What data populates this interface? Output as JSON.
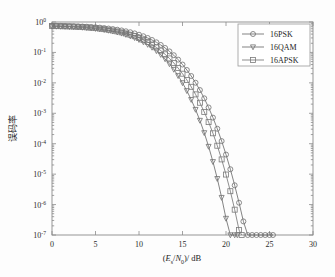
{
  "chart_data": {
    "type": "line",
    "title": "",
    "xlabel": "(E_s/N_0)/dB",
    "xlabel_parts": {
      "open": "(",
      "E": "E",
      "Esub": "s",
      "slash": "/",
      "N": "N",
      "Nsub": "0",
      "close": ")",
      "unit": "/ dB"
    },
    "ylabel": "误码率",
    "ylabel_chars": [
      "误",
      "码",
      "率"
    ],
    "xlim": [
      0,
      30
    ],
    "ylim": [
      1e-07,
      1
    ],
    "yscale": "log",
    "xticks": [
      0,
      5,
      10,
      15,
      20,
      25,
      30
    ],
    "xticklabels": [
      "0",
      "5",
      "10",
      "15",
      "20",
      "25",
      "30"
    ],
    "yticks": [
      1,
      0.1,
      0.01,
      0.001,
      0.0001,
      1e-05,
      1e-06,
      1e-07
    ],
    "yticklabels": [
      "10^0",
      "10^-1",
      "10^-2",
      "10^-3",
      "10^-4",
      "10^-5",
      "10^-6",
      "10^-7"
    ],
    "yticklabel_exponents": [
      "0",
      "-1",
      "-2",
      "-3",
      "-4",
      "-5",
      "-6",
      "-7"
    ],
    "ymantissa": "10",
    "grid": false,
    "legend_position": "upper right",
    "series": [
      {
        "name": "16PSK",
        "marker": "circle",
        "color": "#6e6e6e",
        "x": [
          0,
          0.5,
          1,
          1.5,
          2,
          2.5,
          3,
          3.5,
          4,
          4.5,
          5,
          5.5,
          6,
          6.5,
          7,
          7.5,
          8,
          8.5,
          9,
          9.5,
          10,
          10.5,
          11,
          11.5,
          12,
          12.5,
          13,
          13.5,
          14,
          14.5,
          15,
          15.5,
          16,
          16.5,
          17,
          17.5,
          18,
          18.5,
          19,
          19.5,
          20,
          20.5,
          21,
          21.5,
          22,
          22.5,
          23,
          23.5,
          24,
          24.5,
          25,
          25.4
        ],
        "y": [
          0.75,
          0.748,
          0.745,
          0.74,
          0.735,
          0.728,
          0.72,
          0.71,
          0.7,
          0.685,
          0.67,
          0.652,
          0.632,
          0.61,
          0.585,
          0.558,
          0.528,
          0.495,
          0.46,
          0.422,
          0.382,
          0.34,
          0.298,
          0.256,
          0.215,
          0.176,
          0.14,
          0.108,
          0.081,
          0.058,
          0.04,
          0.0265,
          0.0168,
          0.0101,
          0.0058,
          0.0031,
          0.00155,
          0.00072,
          0.00031,
          0.000122,
          4.4e-05,
          1.45e-05,
          4.3e-06,
          1.15e-06,
          2.8e-07,
          6e-08,
          1.2e-08,
          2.1e-09,
          3.4e-10,
          4.8e-11,
          6e-12,
          1e-07
        ]
      },
      {
        "name": "16QAM",
        "marker": "triangle-down",
        "color": "#6e6e6e",
        "x": [
          0,
          0.5,
          1,
          1.5,
          2,
          2.5,
          3,
          3.5,
          4,
          4.5,
          5,
          5.5,
          6,
          6.5,
          7,
          7.5,
          8,
          8.5,
          9,
          9.5,
          10,
          10.5,
          11,
          11.5,
          12,
          12.5,
          13,
          13.5,
          14,
          14.5,
          15,
          15.5,
          16,
          16.5,
          17,
          17.5,
          18,
          18.5,
          19,
          19.5,
          20,
          20.5,
          21,
          21.3
        ],
        "y": [
          0.72,
          0.716,
          0.712,
          0.705,
          0.697,
          0.687,
          0.675,
          0.661,
          0.645,
          0.627,
          0.606,
          0.582,
          0.556,
          0.527,
          0.495,
          0.461,
          0.424,
          0.385,
          0.345,
          0.303,
          0.262,
          0.221,
          0.182,
          0.146,
          0.113,
          0.0846,
          0.0609,
          0.0419,
          0.0275,
          0.0171,
          0.01,
          0.0055,
          0.00281,
          0.00133,
          0.00058,
          0.000228,
          8.1e-05,
          2.56e-05,
          7.1e-06,
          1.7e-06,
          3.5e-07,
          6e-08,
          8.5e-09,
          1e-07
        ]
      },
      {
        "name": "16APSK",
        "marker": "square",
        "color": "#7a7a7a",
        "x": [
          0,
          0.5,
          1,
          1.5,
          2,
          2.5,
          3,
          3.5,
          4,
          4.5,
          5,
          5.5,
          6,
          6.5,
          7,
          7.5,
          8,
          8.5,
          9,
          9.5,
          10,
          10.5,
          11,
          11.5,
          12,
          12.5,
          13,
          13.5,
          14,
          14.5,
          15,
          15.5,
          16,
          16.5,
          17,
          17.5,
          18,
          18.5,
          19,
          19.5,
          20,
          20.5,
          21,
          21.5,
          21.8
        ],
        "y": [
          0.735,
          0.732,
          0.728,
          0.722,
          0.714,
          0.705,
          0.694,
          0.681,
          0.666,
          0.649,
          0.629,
          0.607,
          0.582,
          0.555,
          0.525,
          0.492,
          0.457,
          0.42,
          0.381,
          0.341,
          0.3,
          0.259,
          0.219,
          0.181,
          0.146,
          0.1145,
          0.0868,
          0.0636,
          0.045,
          0.0306,
          0.02,
          0.0125,
          0.00742,
          0.00418,
          0.00222,
          0.001105,
          0.000513,
          0.00022,
          8.6e-05,
          3.05e-05,
          9.7e-06,
          2.75e-06,
          6.8e-07,
          1.45e-07,
          1e-07
        ]
      }
    ],
    "legend_entries": [
      {
        "label": "16PSK",
        "marker": "circle"
      },
      {
        "label": "16QAM",
        "marker": "triangle-down"
      },
      {
        "label": "16APSK",
        "marker": "square"
      }
    ]
  }
}
